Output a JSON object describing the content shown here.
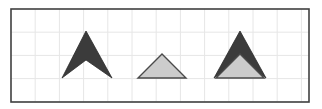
{
  "figure": {
    "canvas": {
      "width": 322,
      "height": 109,
      "background_color": "#ffffff"
    },
    "frame": {
      "x": 11,
      "y": 9,
      "width": 298,
      "height": 93,
      "stroke_color": "#404040",
      "stroke_width": 1.6,
      "fill_color": "#ffffff"
    },
    "grid": {
      "visible": true,
      "cell_width": 24.2,
      "cell_height": 23.2,
      "line_color": "#e6e6e6",
      "line_width": 1,
      "columns": 12,
      "rows": 4
    },
    "palette": {
      "dark_fill": "#3b3b3b",
      "dark_stroke": "#2b2b2b",
      "light_fill": "#cccccc",
      "light_stroke": "#4a4a4a",
      "frame_stroke": "#404040",
      "grid_line": "#e6e6e6",
      "background": "#ffffff"
    },
    "shapes": [
      {
        "id": "chevron-dark",
        "name": "dark-chevron",
        "kind": "chevron",
        "fill": "#3b3b3b",
        "stroke": "#2b2b2b",
        "stroke_width": 0.8,
        "points": "86,31 112,78 86,60 62,78",
        "apex_x": 86,
        "apex_y": 31,
        "base_y": 78,
        "left_x": 62,
        "right_x": 112,
        "notch_y": 60
      },
      {
        "id": "triangle-light",
        "name": "light-triangle",
        "kind": "triangle",
        "fill": "#cccccc",
        "stroke": "#4a4a4a",
        "stroke_width": 1.4,
        "points": "162,54 186,78 138,78",
        "apex_x": 162,
        "apex_y": 54,
        "base_y": 78,
        "left_x": 138,
        "right_x": 186
      },
      {
        "id": "chevron-dark-overlay",
        "name": "dark-chevron-overlay",
        "kind": "chevron",
        "fill": "#3b3b3b",
        "stroke": "#2b2b2b",
        "stroke_width": 0.8,
        "points": "240,31 266,78 240,60 214,78",
        "apex_x": 240,
        "apex_y": 31,
        "base_y": 78,
        "left_x": 214,
        "right_x": 266,
        "notch_y": 60
      },
      {
        "id": "triangle-light-overlay",
        "name": "light-triangle-overlay",
        "kind": "triangle",
        "fill": "#cccccc",
        "stroke": "#4a4a4a",
        "stroke_width": 1.4,
        "points": "240,54 264,78 216,78",
        "apex_x": 240,
        "apex_y": 54,
        "base_y": 78,
        "left_x": 216,
        "right_x": 264
      }
    ]
  }
}
